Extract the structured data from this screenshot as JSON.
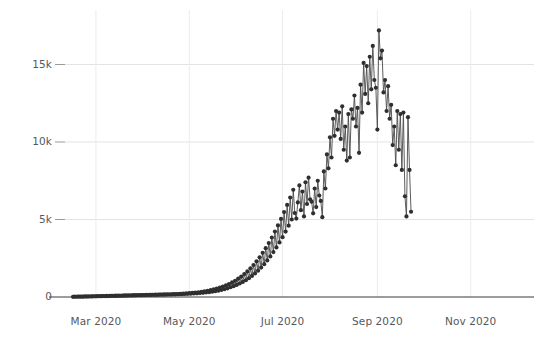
{
  "chart_data": {
    "type": "line",
    "title": "",
    "subtitle": "",
    "xlabel": "",
    "ylabel": "",
    "marker": "circle",
    "grid": "both-light",
    "legend": "none",
    "line_color": "#4a4a4a",
    "marker_color": "#2f2f2f",
    "background_color": "#ffffff",
    "axis_color": "#3a3a3a",
    "gridline_color": "#e7e7e7",
    "tick_label_color": "#56585c",
    "ylim": [
      0,
      18000
    ],
    "yticks": [
      0,
      5000,
      10000,
      15000
    ],
    "ytick_labels": [
      "0",
      "5k",
      "10k",
      "15k"
    ],
    "xlim": [
      "2020-02-15",
      "2020-11-28"
    ],
    "xticks": [
      "2020-03-01",
      "2020-05-01",
      "2020-07-01",
      "2020-09-01",
      "2020-11-01"
    ],
    "xtick_labels": [
      "Mar 2020",
      "May 2020",
      "Jul 2020",
      "Sep 2020",
      "Nov 2020"
    ],
    "x_start": "2020-02-15",
    "x_interval_days": 1,
    "values": [
      12,
      20,
      15,
      25,
      18,
      30,
      22,
      28,
      35,
      26,
      40,
      32,
      45,
      38,
      50,
      42,
      55,
      48,
      60,
      52,
      65,
      58,
      70,
      62,
      75,
      68,
      80,
      72,
      85,
      78,
      90,
      82,
      95,
      88,
      100,
      92,
      105,
      98,
      110,
      102,
      115,
      108,
      120,
      112,
      125,
      118,
      130,
      122,
      135,
      128,
      140,
      132,
      145,
      138,
      150,
      142,
      155,
      148,
      160,
      152,
      165,
      158,
      170,
      162,
      175,
      168,
      180,
      172,
      190,
      178,
      200,
      185,
      215,
      195,
      230,
      205,
      245,
      215,
      260,
      225,
      280,
      240,
      300,
      255,
      330,
      270,
      360,
      290,
      400,
      310,
      440,
      340,
      490,
      370,
      540,
      410,
      600,
      450,
      670,
      500,
      750,
      560,
      840,
      630,
      940,
      700,
      1050,
      780,
      1180,
      870,
      1320,
      970,
      1480,
      1080,
      1650,
      1210,
      1850,
      1360,
      2060,
      1520,
      2300,
      1700,
      2560,
      1900,
      2850,
      2120,
      3150,
      2360,
      3480,
      2620,
      3840,
      2900,
      4220,
      3200,
      4620,
      3520,
      5040,
      3860,
      5480,
      4220,
      5940,
      4600,
      6420,
      5000,
      6920,
      5420,
      5060,
      6100,
      7200,
      5600,
      6800,
      5200,
      7400,
      6000,
      7700,
      6300,
      6150,
      5400,
      7000,
      5800,
      7500,
      6550,
      6200,
      5150,
      8100,
      7000,
      9200,
      8300,
      10300,
      9000,
      11500,
      10400,
      12000,
      10800,
      11900,
      10200,
      12300,
      9500,
      11000,
      8800,
      11800,
      9000,
      12100,
      11500,
      13000,
      11000,
      12200,
      9300,
      13700,
      11900,
      15100,
      13100,
      14900,
      12500,
      15500,
      13400,
      16200,
      14000,
      13500,
      10800,
      17200,
      15400,
      15900,
      13200,
      14000,
      12000,
      13600,
      11500,
      12400,
      9800,
      11000,
      8500,
      12000,
      9500,
      11800,
      8200,
      11900,
      6500,
      5200,
      11600,
      8200,
      5500
    ],
    "peak_value": 17200,
    "peak_label_approx": "~17k (early-mid Nov 2020)"
  },
  "axes": {
    "y_axis_name": "y-axis",
    "x_axis_name": "x-axis"
  }
}
